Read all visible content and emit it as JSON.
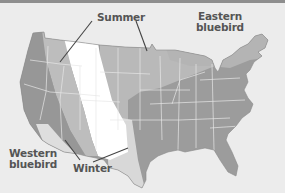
{
  "map": {
    "title": "Bluebird ranges",
    "labels": {
      "summer": "Summer",
      "eastern_line1": "Eastern",
      "eastern_line2": "bluebird",
      "western_line1": "Western",
      "western_line2": "bluebird",
      "winter": "Winter"
    },
    "zones": [
      {
        "name": "Western bluebird year-round",
        "color": "#9a9a9a"
      },
      {
        "name": "Western bluebird summer",
        "color": "#bdbdbd"
      },
      {
        "name": "Western bluebird winter",
        "color": "#dcdcdc"
      },
      {
        "name": "No bluebirds",
        "color": "#ffffff"
      },
      {
        "name": "Eastern bluebird summer",
        "color": "#b8b8b8"
      },
      {
        "name": "Eastern bluebird year-round",
        "color": "#999999"
      },
      {
        "name": "Eastern bluebird winter",
        "color": "#d6d6d6"
      }
    ],
    "colors": {
      "background": "#ececec",
      "state_lines": "#e8e8e8",
      "label_text": "#555555",
      "leader_lines": "#444444"
    }
  }
}
